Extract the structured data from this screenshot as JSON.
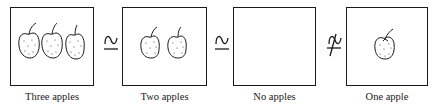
{
  "diagram": {
    "type": "subset-relation-sequence",
    "panels": [
      {
        "id": "three",
        "label": "Three apples",
        "apple_count": 3
      },
      {
        "id": "two",
        "label": "Two apples",
        "apple_count": 2
      },
      {
        "id": "none",
        "label": "No apples",
        "apple_count": 0
      },
      {
        "id": "one",
        "label": "One apple",
        "apple_count": 1
      }
    ],
    "relations": [
      {
        "between": [
          "three",
          "two"
        ],
        "symbol": "⊆",
        "meaning": "subset-or-equal (handwritten)"
      },
      {
        "between": [
          "two",
          "none"
        ],
        "symbol": "⊆",
        "meaning": "subset-or-equal (handwritten)"
      },
      {
        "between": [
          "none",
          "one"
        ],
        "symbol": "⊈",
        "meaning": "not-subset (handwritten, struck through)"
      }
    ],
    "colors": {
      "line": "#1a1a1a",
      "background": "#ffffff"
    }
  }
}
